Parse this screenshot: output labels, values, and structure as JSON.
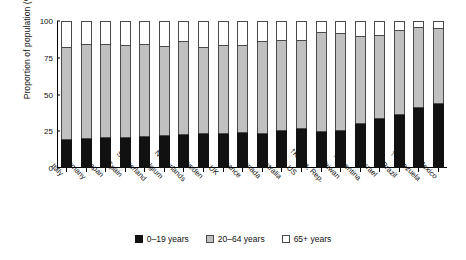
{
  "chart_data": {
    "type": "bar",
    "subtype": "stacked-bar-100",
    "title": "",
    "xlabel": "",
    "ylabel": "Proportion of population (%)",
    "ylim": [
      0,
      100
    ],
    "yticks": [
      0,
      25,
      50,
      75,
      100
    ],
    "grid": false,
    "legend_position": "bottom-center",
    "categories": [
      "Italy",
      "Germany",
      "Japan",
      "Spain",
      "Switzerland",
      "Belgium",
      "Netherlands",
      "Sweden",
      "UK",
      "France",
      "Canada",
      "Australia",
      "US",
      "†Korea, Rep.",
      "†Taiwan",
      "†Argentina",
      "Israel",
      "†Brazil",
      "†Venezuela",
      "†Mexico"
    ],
    "series": [
      {
        "name": "0–19 years",
        "color": "#111111",
        "values": [
          19.5,
          20.6,
          20.8,
          21.2,
          22.0,
          22.7,
          23.2,
          23.8,
          24.0,
          24.6,
          23.5,
          25.8,
          27.5,
          25.3,
          26.0,
          30.5,
          34.0,
          36.5,
          41.5,
          44.0
        ]
      },
      {
        "name": "20–64 years",
        "color": "#c0c0c0",
        "values": [
          62.5,
          63.9,
          63.7,
          62.8,
          62.5,
          60.6,
          63.3,
          58.6,
          60.0,
          59.4,
          63.0,
          61.2,
          59.5,
          67.2,
          65.8,
          59.0,
          56.2,
          57.5,
          54.1,
          51.4
        ]
      },
      {
        "name": "65+ years",
        "color": "#ffffff",
        "values": [
          18.0,
          15.5,
          15.5,
          16.0,
          15.5,
          16.7,
          13.5,
          17.6,
          16.0,
          16.0,
          13.5,
          13.0,
          13.0,
          7.5,
          8.2,
          10.5,
          9.8,
          6.0,
          4.4,
          4.6
        ]
      }
    ]
  },
  "legend": {
    "items": [
      {
        "label": "0–19 years",
        "swatch": "sw-young"
      },
      {
        "label": "20–64 years",
        "swatch": "sw-mid"
      },
      {
        "label": "65+ years",
        "swatch": "sw-old"
      }
    ]
  }
}
